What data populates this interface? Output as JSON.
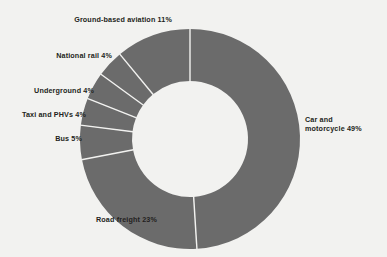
{
  "chart_data": {
    "type": "pie",
    "variant": "donut",
    "title": "",
    "subtitle": "",
    "xlabel": "",
    "ylabel": "",
    "legend": "none",
    "grid": false,
    "unit": "%",
    "total": 100,
    "start_angle_deg": 0,
    "direction": "clockwise",
    "categories": [
      "Car and motorcycle",
      "Road freight",
      "Bus",
      "Taxi and PHVs",
      "Underground",
      "National rail",
      "Ground-based aviation"
    ],
    "values": [
      49,
      23,
      5,
      4,
      4,
      4,
      11
    ],
    "labels": [
      "Car and\nmotorcycle 49%",
      "Road freight 23%",
      "Bus 5%",
      "Taxi and PHVs 4%",
      "Underground 4%",
      "National rail 4%",
      "Ground-based aviation 11%"
    ],
    "slice_color": "#6b6b6b",
    "separator_color": "#f2f2f0",
    "background_color": "#f2f2f0",
    "text_color": "#231f20"
  },
  "geometry": {
    "center_x": 190,
    "center_y": 139,
    "outer_radius": 110,
    "inner_radius": 58,
    "separator_width": 1.4
  }
}
